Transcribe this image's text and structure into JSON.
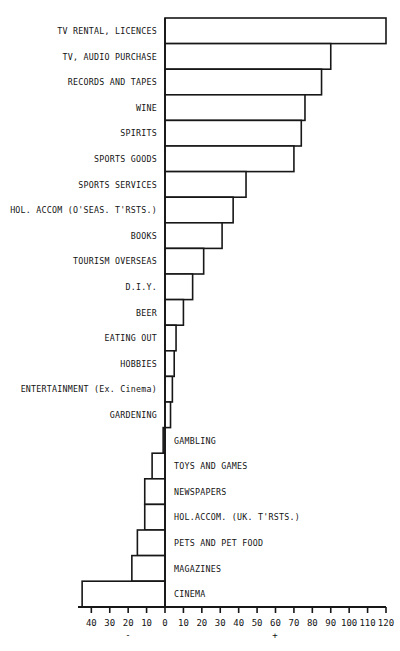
{
  "chart_data": {
    "type": "bar",
    "orientation": "horizontal",
    "title": "",
    "subtitle": "",
    "xlabel": "",
    "ylabel": "",
    "xlim": [
      -40,
      120
    ],
    "grid": false,
    "legend": null,
    "axis_ticks": [
      "40",
      "30",
      "20",
      "10",
      "0",
      "10",
      "20",
      "30",
      "40",
      "50",
      "60",
      "70",
      "80",
      "90",
      "100",
      "110",
      "120"
    ],
    "axis_tick_values": [
      -40,
      -30,
      -20,
      -10,
      0,
      10,
      20,
      30,
      40,
      50,
      60,
      70,
      80,
      90,
      100,
      110,
      120
    ],
    "negative_sign": "-",
    "positive_sign": "+",
    "categories": [
      "TV RENTAL, LICENCES",
      "TV, AUDIO PURCHASE",
      "RECORDS AND TAPES",
      "WINE",
      "SPIRITS",
      "SPORTS GOODS",
      "SPORTS SERVICES",
      "HOL. ACCOM (O'SEAS. T'RSTS.)",
      "BOOKS",
      "TOURISM OVERSEAS",
      "D.I.Y.",
      "BEER",
      "EATING OUT",
      "HOBBIES",
      "ENTERTAINMENT (Ex. Cinema)",
      "GARDENING",
      "GAMBLING",
      "TOYS AND GAMES",
      "NEWSPAPERS",
      "HOL.ACCOM. (UK. T'RSTS.)",
      "PETS AND PET FOOD",
      "MAGAZINES",
      "CINEMA"
    ],
    "values": [
      120,
      90,
      85,
      76,
      74,
      70,
      44,
      37,
      31,
      21,
      15,
      10,
      6,
      5,
      4,
      3,
      -1,
      -7,
      -11,
      -11,
      -15,
      -18,
      -45
    ]
  }
}
